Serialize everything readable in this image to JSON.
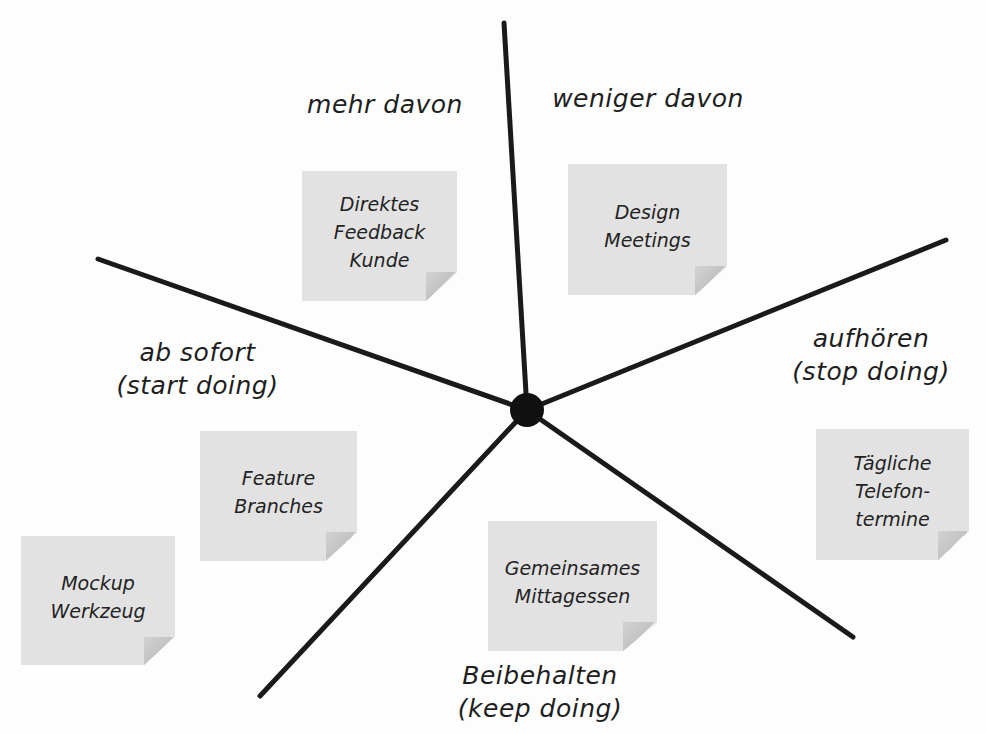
{
  "diagram": {
    "type": "retrospective-starfish",
    "colors": {
      "background": "#fdfdfd",
      "line": "#1a1a1a",
      "center_dot": "#111111",
      "note_fill": "#e2e2e2",
      "note_fold": "#c6c6c6",
      "text": "#1e1e1e"
    },
    "center": {
      "x": 527,
      "y": 410,
      "r": 17
    },
    "spokes": [
      {
        "name": "top",
        "x": 504,
        "y": 23
      },
      {
        "name": "right",
        "x": 946,
        "y": 240
      },
      {
        "name": "lower-right",
        "x": 853,
        "y": 637
      },
      {
        "name": "lower-left",
        "x": 260,
        "y": 696
      },
      {
        "name": "left",
        "x": 98,
        "y": 259
      }
    ],
    "categories": {
      "more_of": {
        "line1": "mehr davon"
      },
      "less_of": {
        "line1": "weniger davon"
      },
      "stop": {
        "line1": "aufhören",
        "line2": "(stop doing)"
      },
      "keep": {
        "line1": "Beibehalten",
        "line2": "(keep doing)"
      },
      "start": {
        "line1": "ab sofort",
        "line2": "(start doing)"
      }
    },
    "notes": [
      {
        "category": "mehr davon",
        "lines": [
          "Direktes",
          "Feedback",
          "Kunde"
        ]
      },
      {
        "category": "weniger davon",
        "lines": [
          "Design",
          "Meetings"
        ]
      },
      {
        "category": "aufhören",
        "lines": [
          "Tägliche",
          "Telefon-",
          "termine"
        ]
      },
      {
        "category": "Beibehalten",
        "lines": [
          "Gemeinsames",
          "Mittagessen"
        ]
      },
      {
        "category": "ab sofort",
        "lines": [
          "Feature",
          "Branches"
        ]
      },
      {
        "category": "ab sofort",
        "lines": [
          "Mockup",
          "Werkzeug"
        ]
      }
    ]
  }
}
